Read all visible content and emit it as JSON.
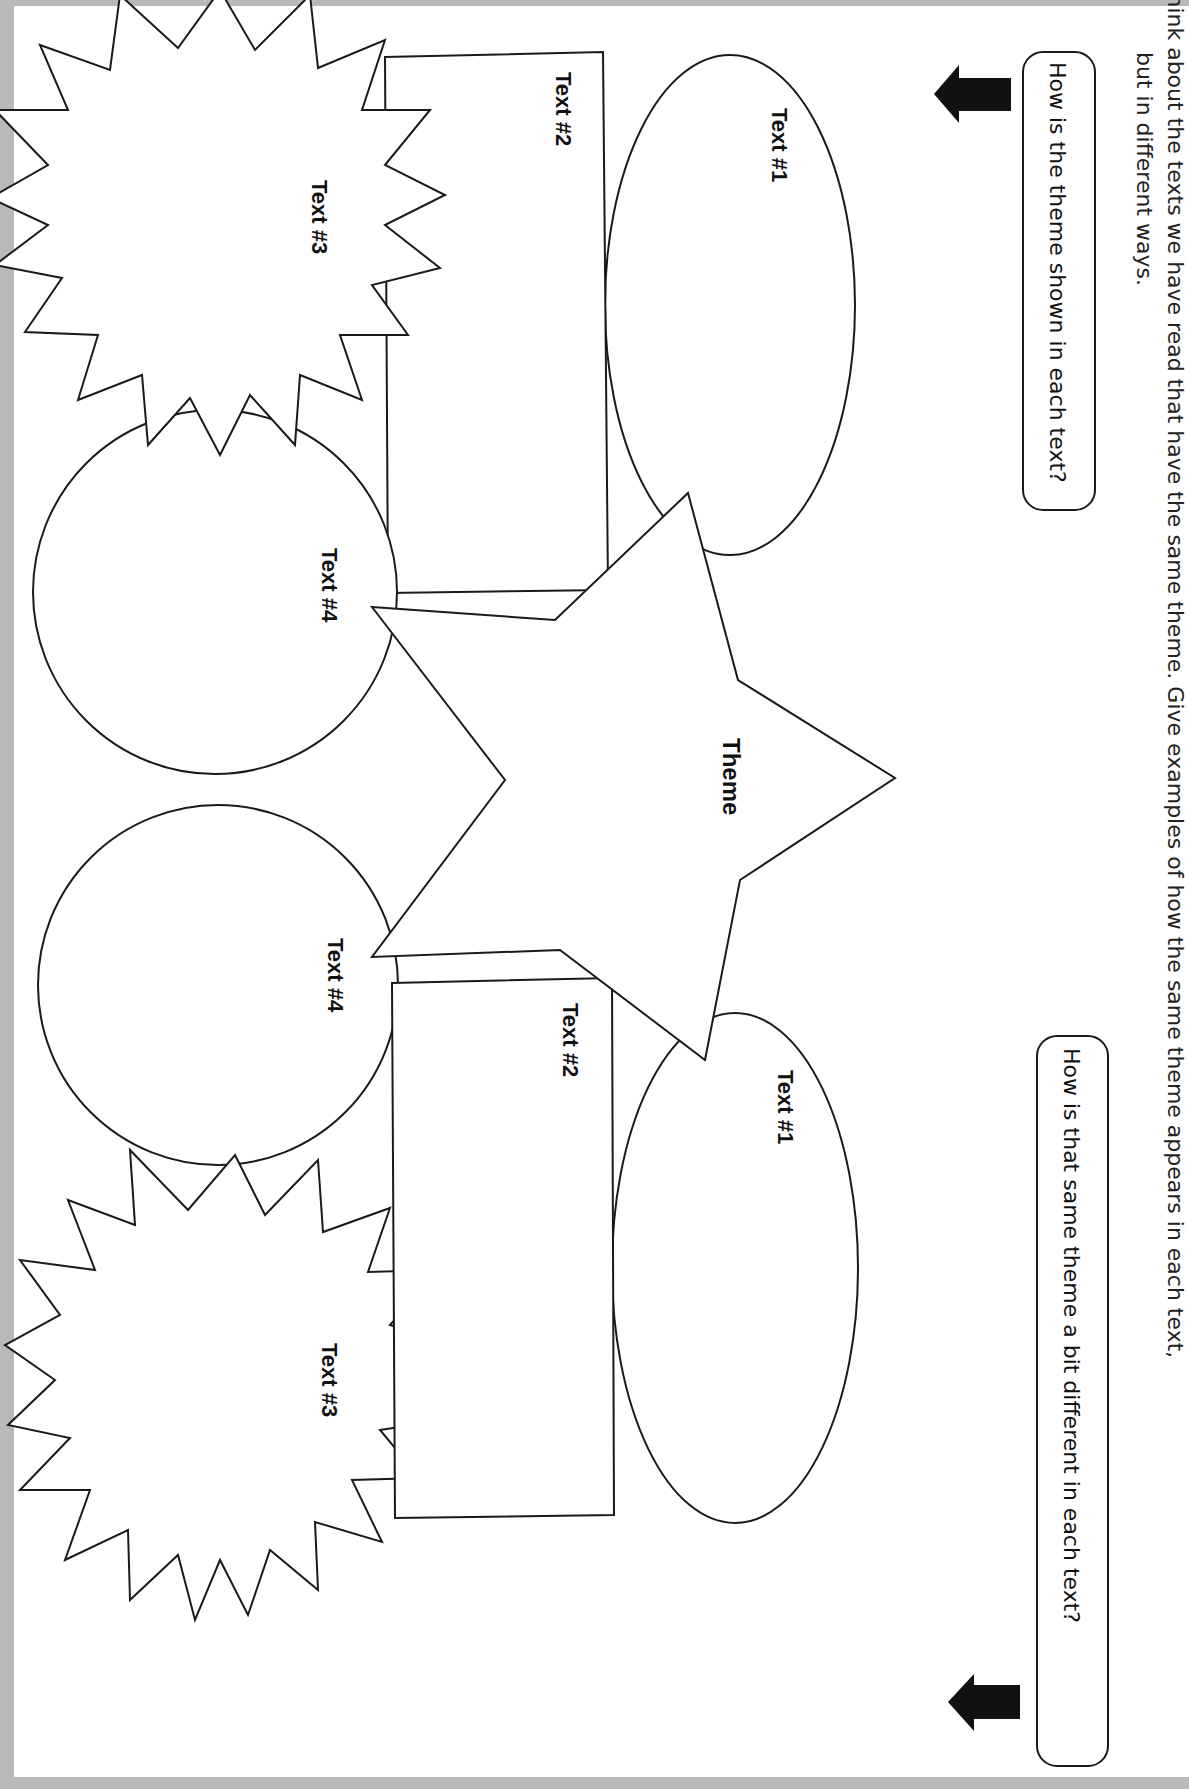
{
  "instructions": {
    "line1": "Think about the texts we have read that have the same theme. Give examples of how the same theme appears in each text,",
    "line2": "but in different ways."
  },
  "prompts": {
    "top": "How is the theme shown in each text?",
    "bottom": "How is that same theme a bit different in each text?"
  },
  "center": {
    "label": "Theme"
  },
  "upper_organizer": {
    "text1": "Text #1",
    "text2": "Text #2",
    "text3": "Text #3",
    "text4": "Text #4"
  },
  "lower_organizer": {
    "text1": "Text #1",
    "text2": "Text #2",
    "text3": "Text #3",
    "text4": "Text #4"
  },
  "icons": {
    "top_arrow": "arrow-left-icon",
    "bottom_arrow": "arrow-left-icon"
  },
  "colors": {
    "ink": "#1a1a1a",
    "paper": "#ffffff",
    "scan_edge": "#b9b9b9"
  }
}
